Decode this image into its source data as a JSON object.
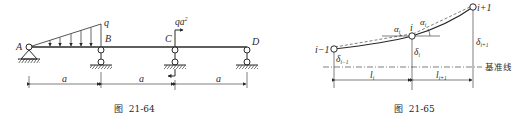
{
  "figure_64": {
    "caption": "图  21-64",
    "points": {
      "A": "A",
      "B": "B",
      "C": "C",
      "D": "D"
    },
    "load_label": "q",
    "moment_label": "qa²",
    "moment_label_base": "qa",
    "moment_label_sup": "2",
    "spans": [
      "a",
      "a",
      "a"
    ]
  },
  "figure_65": {
    "caption": "图  21-65",
    "nodes": {
      "prev": "i−1",
      "curr": "i",
      "next": "i+1"
    },
    "angles": {
      "left": "α",
      "left_sub": "i",
      "right": "α",
      "right_sub": "i"
    },
    "deflections": {
      "prev": "δ",
      "prev_sub": "i−1",
      "curr": "δ",
      "curr_sub": "i",
      "next": "δ",
      "next_sub": "i+1"
    },
    "lengths": {
      "left": "l",
      "left_sub": "i",
      "right": "l",
      "right_sub": "i+1"
    },
    "datum_label": "基准线"
  },
  "colors": {
    "ink": "#2a2a2a",
    "background": "#ffffff"
  }
}
